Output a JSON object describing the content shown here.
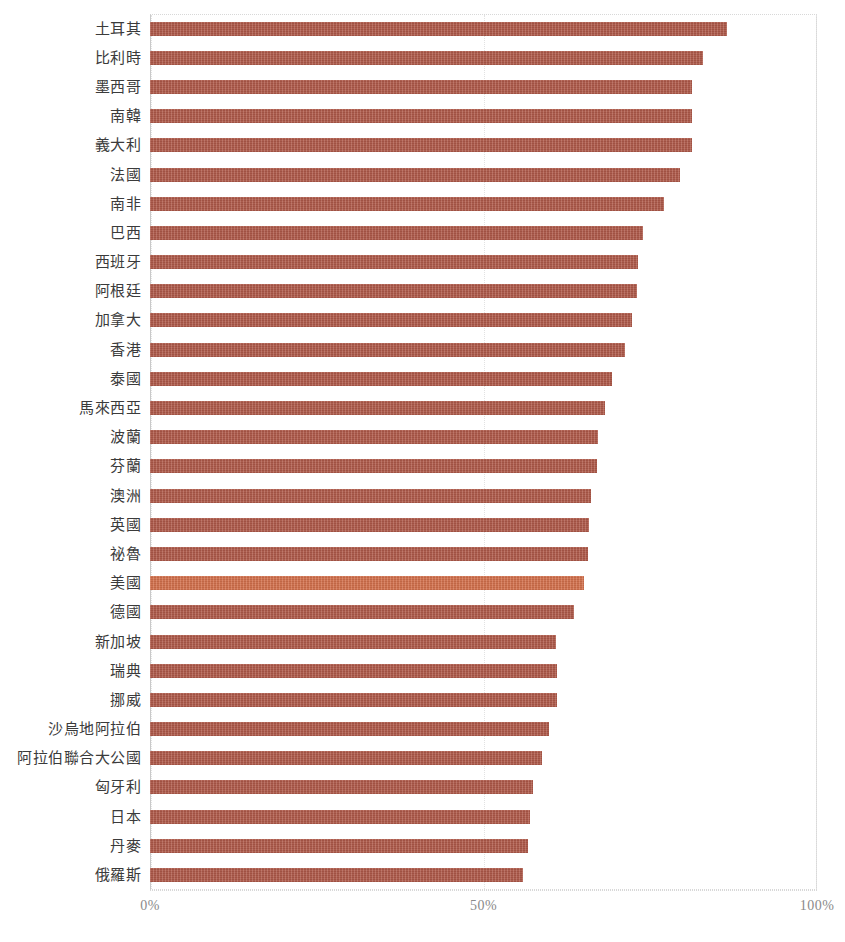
{
  "chart_data": {
    "type": "bar",
    "orientation": "horizontal",
    "title": "",
    "subtitle": "",
    "xlabel": "",
    "ylabel": "",
    "xlim": [
      0,
      100
    ],
    "xtick_labels": [
      "0%",
      "50%",
      "100%"
    ],
    "xtick_values": [
      0,
      50,
      100
    ],
    "grid": true,
    "legend": false,
    "legend_position": "none",
    "bar_color": "#b05a4a",
    "highlight_color": "#d4714c",
    "highlight_category": "美國",
    "categories": [
      "土耳其",
      "比利時",
      "墨西哥",
      "南韓",
      "義大利",
      "法國",
      "南非",
      "巴西",
      "西班牙",
      "阿根廷",
      "加拿大",
      "香港",
      "泰國",
      "馬來西亞",
      "波蘭",
      "芬蘭",
      "澳洲",
      "英國",
      "祕魯",
      "美國",
      "德國",
      "新加坡",
      "瑞典",
      "挪威",
      "沙烏地阿拉伯",
      "阿拉伯聯合大公國",
      "匈牙利",
      "日本",
      "丹麥",
      "俄羅斯"
    ],
    "values": [
      86.5,
      82.9,
      81.3,
      81.3,
      81.3,
      79.5,
      77.1,
      73.9,
      73.2,
      73.0,
      72.3,
      71.2,
      69.3,
      68.2,
      67.2,
      67.0,
      66.1,
      65.8,
      65.7,
      65.0,
      63.6,
      60.9,
      61.0,
      61.0,
      59.8,
      58.8,
      57.4,
      57.0,
      56.7,
      55.9
    ]
  }
}
